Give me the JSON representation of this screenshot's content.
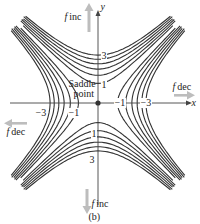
{
  "figure": {
    "caption": "(b)",
    "axes": {
      "x_label": "x",
      "y_label": "y"
    },
    "saddle_label_line1": "Saddle",
    "saddle_label_line2": "point",
    "arrows": {
      "up": {
        "f": "f",
        "text": "inc"
      },
      "down": {
        "f": "f",
        "text": "inc"
      },
      "left": {
        "f": "f",
        "text": "dec"
      },
      "right": {
        "f": "f",
        "text": "dec"
      }
    },
    "level_labels": {
      "top_3": "3",
      "top_1": "1",
      "bottom_1": "1",
      "bottom_3": "3",
      "right_neg1": "−1",
      "right_neg3": "−3",
      "left_neg1": "−1",
      "left_neg3": "−3"
    },
    "colors": {
      "contour": "#333333",
      "axis": "#444444",
      "arrow": "#b9b9b9",
      "saddle_dot": "#333333"
    },
    "contour_levels": [
      1,
      2,
      3,
      4,
      5,
      6,
      -1,
      -2,
      -3,
      -4,
      -5,
      -6
    ]
  }
}
